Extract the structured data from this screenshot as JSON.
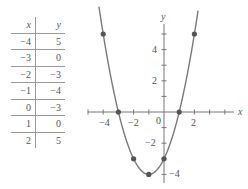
{
  "table": {
    "headers": [
      "x",
      "y"
    ],
    "rows": [
      [
        "−4",
        "5"
      ],
      [
        "−3",
        "0"
      ],
      [
        "−2",
        "−3"
      ],
      [
        "−1",
        "−4"
      ],
      [
        "0",
        "−3"
      ],
      [
        "1",
        "0"
      ],
      [
        "2",
        "5"
      ]
    ]
  },
  "axes": {
    "x_label": "x",
    "y_label": "y",
    "x_ticks": [
      "−4",
      "−2",
      "0",
      "2"
    ],
    "y_ticks": [
      "4",
      "2",
      "−2",
      "−4"
    ]
  },
  "colors": {
    "curve": "#7a7a7a",
    "point": "#555555",
    "axis": "#777777"
  },
  "chart_data": {
    "type": "line",
    "title": "",
    "function": "y = x^2 + 2x - 3",
    "xlabel": "x",
    "ylabel": "y",
    "x": [
      -4,
      -3,
      -2,
      -1,
      0,
      1,
      2
    ],
    "values": [
      5,
      0,
      -3,
      -4,
      -3,
      0,
      5
    ],
    "points": [
      [
        -4,
        5
      ],
      [
        -3,
        0
      ],
      [
        -2,
        -3
      ],
      [
        -1,
        -4
      ],
      [
        0,
        -3
      ],
      [
        1,
        0
      ],
      [
        2,
        5
      ]
    ],
    "xlim": [
      -5,
      4
    ],
    "ylim": [
      -4.5,
      5.5
    ],
    "x_tick_labels": [
      -4,
      -2,
      0,
      2
    ],
    "y_tick_labels": [
      4,
      2,
      -2,
      -4
    ],
    "grid": false,
    "legend": "none"
  }
}
